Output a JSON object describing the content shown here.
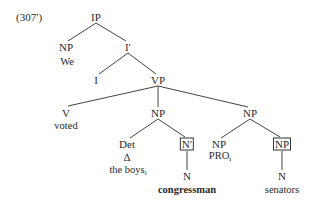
{
  "example_number": "(307′)",
  "nodes": {
    "ip": "IP",
    "np_subject": "NP",
    "word_we": "We",
    "i_bar": "I′",
    "i": "I",
    "vp": "VP",
    "v": "V",
    "word_voted": "voted",
    "np_object": "NP",
    "np_secondary": "NP",
    "det": "Det",
    "det_triangle": "Δ",
    "word_the_boys": "the boys",
    "the_boys_index": "i",
    "n_bar_boxed": "N′",
    "n_congressman": "N",
    "word_congressman": "congressman",
    "np_pro": "NP",
    "word_pro": "PRO",
    "pro_index": "i",
    "np_boxed": "NP",
    "n_senators": "N",
    "word_senators": "senators"
  },
  "colors": {
    "text": "#2a2a2a",
    "lines": "#444444",
    "background": "#ffffff"
  }
}
